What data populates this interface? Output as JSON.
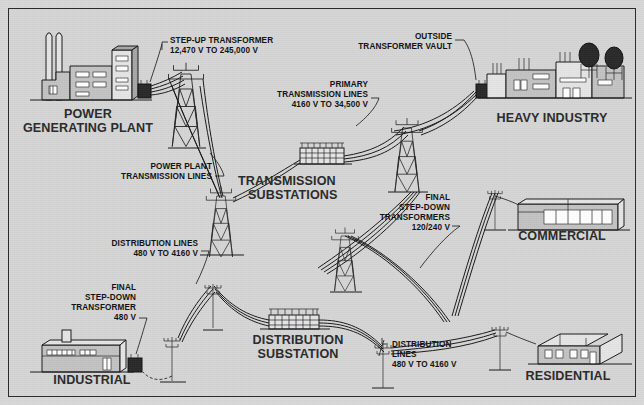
{
  "diagram": {
    "colors": {
      "background": "#d6d6d6",
      "ink": "#1a1a1a",
      "building_fill": "#c2c2c2",
      "building_fill_light": "#e4e4e4",
      "transformer_fill": "#2a2a2a",
      "label_text": "#111111",
      "heading_text": "#2a2a2a"
    },
    "callouts": [
      {
        "name": "step-up-transformer",
        "lines": [
          "STEP-UP TRANSFORMER",
          "12,470 V TO 245,000 V"
        ],
        "align": "left",
        "x": 170,
        "y": 37
      },
      {
        "name": "outside-transformer-vault",
        "lines": [
          "OUTSIDE",
          "TRANSFORMER VAULT"
        ],
        "align": "right",
        "x": 380,
        "y": 33
      },
      {
        "name": "primary-transmission-lines",
        "lines": [
          "PRIMARY",
          "TRANSMISSION LINES",
          "4160 V TO 34,500 V"
        ],
        "align": "right",
        "x": 262,
        "y": 81
      },
      {
        "name": "power-plant-transmission-lines",
        "lines": [
          "POWER PLANT",
          "TRANSMISSION LINES"
        ],
        "align": "right",
        "x": 75,
        "y": 168
      },
      {
        "name": "final-step-down-transformers-commercial",
        "lines": [
          "FINAL",
          "STEP-DOWN",
          "TRANSFORMERS",
          "120/240 V"
        ],
        "align": "right",
        "x": 380,
        "y": 194
      },
      {
        "name": "distribution-lines-upper",
        "lines": [
          "DISTRIBUTION LINES",
          "480 V TO 4160 V"
        ],
        "align": "right",
        "x": 70,
        "y": 240
      },
      {
        "name": "final-step-down-transformer-industrial",
        "lines": [
          "FINAL",
          "STEP-DOWN",
          "TRANSFORMER",
          "480 V"
        ],
        "align": "right",
        "x": 25,
        "y": 289
      },
      {
        "name": "distribution-lines-lower",
        "lines": [
          "DISTRIBUTION",
          "LINES",
          "480 V TO 4160 V"
        ],
        "align": "left",
        "x": 392,
        "y": 341
      }
    ],
    "headings": [
      {
        "name": "power-generating-plant",
        "lines": [
          "POWER",
          "GENERATING PLANT"
        ],
        "align": "center",
        "x": 88,
        "y": 108
      },
      {
        "name": "heavy-industry",
        "lines": [
          "HEAVY INDUSTRY"
        ],
        "align": "center",
        "x": 552,
        "y": 115
      },
      {
        "name": "transmission-substations",
        "lines": [
          "TRANSMISSION",
          "SUBSTATIONS"
        ],
        "align": "left",
        "x": 238,
        "y": 178
      },
      {
        "name": "commercial",
        "lines": [
          "COMMERCIAL"
        ],
        "align": "center",
        "x": 562,
        "y": 232
      },
      {
        "name": "distribution-substation",
        "lines": [
          "DISTRIBUTION",
          "SUBSTATION"
        ],
        "align": "center",
        "x": 298,
        "y": 338
      },
      {
        "name": "residential",
        "lines": [
          "RESIDENTIAL"
        ],
        "align": "center",
        "x": 566,
        "y": 351
      },
      {
        "name": "industrial",
        "lines": [
          "INDUSTRIAL"
        ],
        "align": "center",
        "x": 90,
        "y": 370
      }
    ],
    "nodes": [
      {
        "name": "power-generating-plant-building",
        "type": "plant"
      },
      {
        "name": "step-up-transformer-box",
        "type": "transformer"
      },
      {
        "name": "transmission-tower-a",
        "type": "lattice-tower"
      },
      {
        "name": "transmission-tower-b",
        "type": "lattice-tower"
      },
      {
        "name": "transmission-substation-yard",
        "type": "substation"
      },
      {
        "name": "transmission-tower-c",
        "type": "lattice-tower"
      },
      {
        "name": "outside-transformer-vault-box",
        "type": "transformer"
      },
      {
        "name": "heavy-industry-building",
        "type": "factory"
      },
      {
        "name": "transmission-tower-d",
        "type": "lattice-tower"
      },
      {
        "name": "distribution-substation-yard",
        "type": "substation"
      },
      {
        "name": "distribution-pole-industrial",
        "type": "pole"
      },
      {
        "name": "industrial-building",
        "type": "industrial"
      },
      {
        "name": "final-step-down-transformer-industrial-box",
        "type": "transformer"
      },
      {
        "name": "distribution-pole-1",
        "type": "pole"
      },
      {
        "name": "distribution-pole-2",
        "type": "pole"
      },
      {
        "name": "distribution-pole-3",
        "type": "pole"
      },
      {
        "name": "distribution-pole-commercial",
        "type": "pole"
      },
      {
        "name": "commercial-building",
        "type": "commercial"
      },
      {
        "name": "residential-building",
        "type": "house"
      }
    ]
  }
}
